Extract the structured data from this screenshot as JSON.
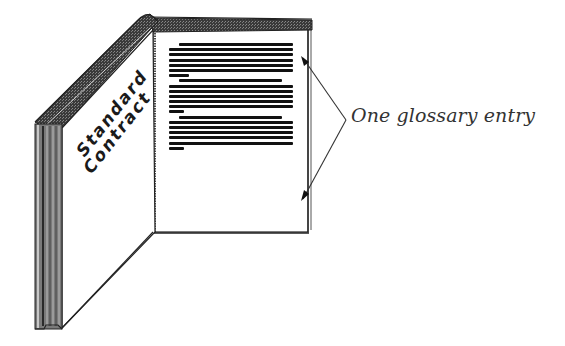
{
  "figure": {
    "type": "illustration",
    "cover": {
      "title_line1": "Standard",
      "title_line2": "Contract"
    },
    "page": {
      "paragraph_count": 3,
      "paragraphs": [
        {
          "lines": [
            1.0,
            1.0,
            1.0,
            1.0,
            1.0,
            1.0,
            0.16
          ]
        },
        {
          "lines": [
            0.9,
            1.0,
            1.0,
            1.0,
            1.0,
            1.0,
            0.12
          ]
        },
        {
          "lines": [
            0.9,
            1.0,
            1.0,
            1.0,
            1.0,
            1.0,
            0.12
          ]
        }
      ]
    },
    "annotation": {
      "label": "One glossary entry",
      "bracket_type": "angle-bracket with arrows"
    }
  },
  "colors": {
    "ink": "#111111",
    "cover_band": "#4a4a4a",
    "spine": "#6e6e6e",
    "label": "#333333",
    "background": "#ffffff"
  }
}
